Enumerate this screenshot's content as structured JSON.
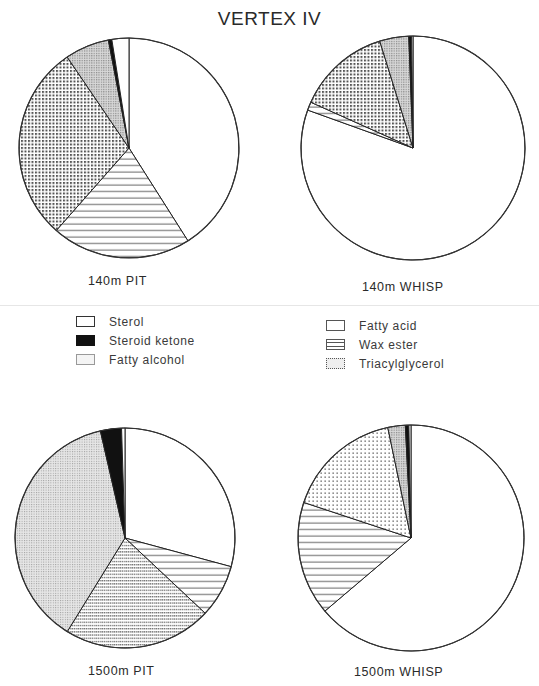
{
  "title": "VERTEX IV",
  "legend": {
    "left": [
      {
        "label": "Sterol",
        "key": "sterol"
      },
      {
        "label": "Steroid ketone",
        "key": "steroid_ketone"
      },
      {
        "label": "Fatty alcohol",
        "key": "fatty_alcohol"
      }
    ],
    "right": [
      {
        "label": "Fatty acid",
        "key": "fatty_acid"
      },
      {
        "label": "Wax ester",
        "key": "wax_ester"
      },
      {
        "label": "Triacylglycerol",
        "key": "triacylglycerol"
      }
    ]
  },
  "pies": [
    {
      "label": "140m PIT"
    },
    {
      "label": "140m WHISP"
    },
    {
      "label": "1500m PIT"
    },
    {
      "label": "1500m WHISP"
    }
  ],
  "chart_data": [
    {
      "type": "pie",
      "title": "140m PIT",
      "categories": [
        "Fatty acid",
        "Wax ester",
        "Triacylglycerol",
        "Fatty alcohol",
        "Steroid ketone",
        "Sterol"
      ],
      "values": [
        41,
        20.5,
        29,
        6.5,
        0.5,
        2.5
      ],
      "start_angle": "12 o'clock, clockwise"
    },
    {
      "type": "pie",
      "title": "140m WHISP",
      "categories": [
        "Fatty acid",
        "Wax ester",
        "Triacylglycerol",
        "Fatty alcohol",
        "Steroid ketone",
        "Sterol"
      ],
      "values": [
        80.5,
        1.2,
        13.5,
        4.2,
        0.4,
        0.2
      ],
      "start_angle": "12 o'clock, clockwise"
    },
    {
      "type": "pie",
      "title": "1500m PIT",
      "categories": [
        "Fatty acid",
        "Wax ester",
        "Triacylglycerol",
        "Fatty alcohol",
        "Steroid ketone",
        "Sterol"
      ],
      "values": [
        29.2,
        7.8,
        21.8,
        37.6,
        3.1,
        0.5
      ],
      "start_angle": "12 o'clock, clockwise"
    },
    {
      "type": "pie",
      "title": "1500m WHISP",
      "categories": [
        "Fatty acid",
        "Wax ester",
        "Triacylglycerol",
        "Fatty alcohol",
        "Steroid ketone",
        "Sterol"
      ],
      "values": [
        63.8,
        16.3,
        16.6,
        2.5,
        0.5,
        0.3
      ],
      "start_angle": "12 o'clock, clockwise"
    }
  ],
  "layout": {
    "pies": [
      {
        "cx": 129,
        "cy": 148,
        "r": 110
      },
      {
        "cx": 413,
        "cy": 148,
        "r": 112
      },
      {
        "cx": 125,
        "cy": 538,
        "r": 110
      },
      {
        "cx": 411,
        "cy": 538,
        "r": 113
      }
    ]
  }
}
